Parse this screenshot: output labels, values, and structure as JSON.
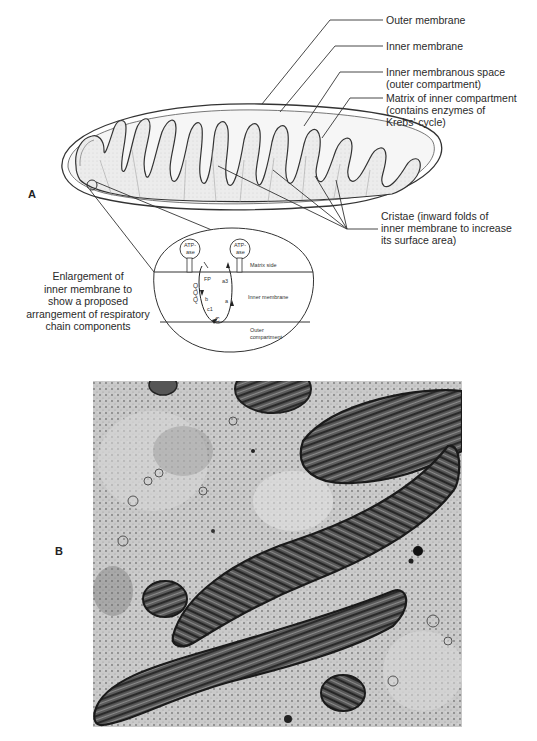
{
  "panel_a": {
    "letter": "A",
    "labels": {
      "outer_membrane": "Outer membrane",
      "inner_membrane": "Inner membrane",
      "inner_membranous_space_1": "Inner membranous space",
      "inner_membranous_space_2": "(outer compartment)",
      "matrix_1": "Matrix of inner compartment",
      "matrix_2": "(contains enzymes of",
      "matrix_3": "Krebs' cycle)",
      "cristae_1": "Cristae (inward folds of",
      "cristae_2": "inner membrane to increase",
      "cristae_3": "its surface area)"
    },
    "enlargement_caption": {
      "line1": "Enlargement of",
      "line2": "inner membrane to",
      "line3": "show a proposed",
      "line4": "arrangement of respiratory",
      "line5": "chain components"
    },
    "inset": {
      "atpase_left_1": "ATP-",
      "atpase_left_2": "ase",
      "atpase_right_1": "ATP-",
      "atpase_right_2": "ase",
      "matrix_side": "Matrix side",
      "inner_membrane": "Inner membrane",
      "outer_compartment_1": "Outer",
      "outer_compartment_2": "compartment",
      "fp": "FP",
      "q1": "Q",
      "q2": "Q",
      "q3": "Q",
      "b": "b",
      "c1": "c1",
      "c": "C",
      "a": "a",
      "a3": "a3"
    }
  },
  "panel_b": {
    "letter": "B"
  }
}
